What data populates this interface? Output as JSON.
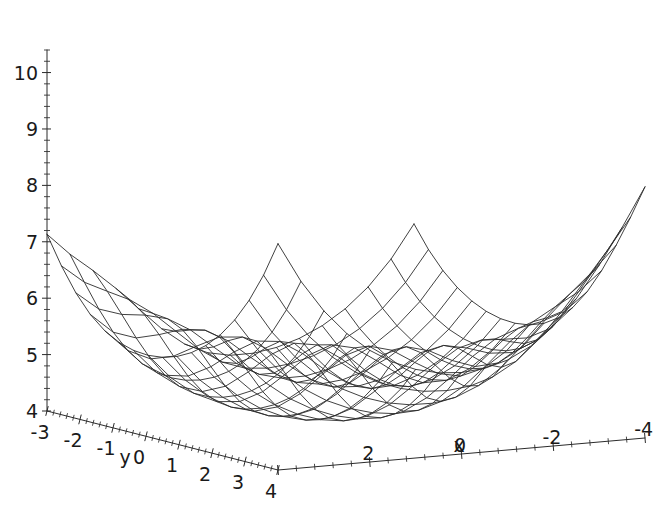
{
  "chart_data": {
    "type": "surface",
    "title": "",
    "xlabel": "x",
    "ylabel": "y",
    "zlabel": "",
    "grid": false,
    "legend": null,
    "projection": "3d-wireframe",
    "mesh_style": "wireframe-quadrilateral",
    "line_color": "#2b2b2b",
    "background_color": "#ffffff",
    "xlim": [
      -4,
      4
    ],
    "ylim": [
      -3,
      4
    ],
    "zlim": [
      4,
      10.4
    ],
    "x_axis": {
      "name": "x",
      "direction": "right-to-left-decreasing",
      "major_ticks": [
        4,
        2,
        0,
        -2,
        -4
      ],
      "major_tick_labels": [
        "4",
        "2",
        "0",
        "-2",
        "-4"
      ],
      "visible_tick_labels": [
        "2",
        "0",
        "-2",
        "-4"
      ],
      "minor_ticks_per_interval": 4
    },
    "y_axis": {
      "name": "y",
      "direction": "left-to-right-increasing",
      "major_ticks": [
        -3,
        -2,
        -1,
        0,
        1,
        2,
        3,
        4
      ],
      "major_tick_labels": [
        "-3",
        "-2",
        "-1",
        "0",
        "1",
        "2",
        "3",
        "4"
      ],
      "minor_ticks_per_interval": 4
    },
    "z_axis": {
      "name": "",
      "major_ticks": [
        4,
        5,
        6,
        7,
        8,
        9,
        10
      ],
      "major_tick_labels": [
        "4",
        "5",
        "6",
        "7",
        "8",
        "9",
        "10"
      ],
      "minor_ticks_per_interval": 4,
      "range_shown": [
        4,
        10.4
      ]
    },
    "surface": {
      "description": "bowl-shaped quartic valley with central ridge and four raised corners",
      "nx": 16,
      "ny": 16,
      "z_min_observed": 4.0,
      "z_max_observed": 10.4,
      "features": [
        {
          "name": "back-left-corner-peak",
          "z": 10.4
        },
        {
          "name": "back-center-peak",
          "z": 10.4
        },
        {
          "name": "back-right-corner-peak",
          "z": 10.0
        },
        {
          "name": "central-ridge-saddle",
          "z": 8.8
        },
        {
          "name": "valley-floor",
          "z": 4.0
        }
      ]
    }
  },
  "axes_labels": {
    "x_name": "x",
    "y_name": "y",
    "z_ticks": [
      "10",
      "9",
      "8",
      "7",
      "6",
      "5",
      "4"
    ],
    "y_ticks": [
      "-3",
      "-2",
      "-1",
      "0",
      "1",
      "2",
      "3",
      "4"
    ],
    "x_ticks": [
      "2",
      "0",
      "-2",
      "-4"
    ],
    "x_origin_tick": "4"
  }
}
